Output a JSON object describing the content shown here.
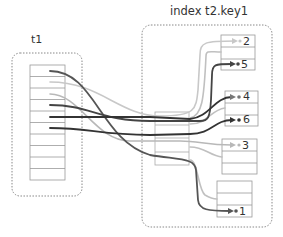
{
  "diagram": {
    "table_label": "t1",
    "index_label": "index t2.key1",
    "table_rows": 10,
    "index_pages": [
      {
        "id": "page-a",
        "entries": [
          "2",
          "",
          "5"
        ]
      },
      {
        "id": "page-b",
        "entries": [
          "4",
          "",
          "6"
        ]
      },
      {
        "id": "page-c",
        "entries": [
          "3",
          "",
          ""
        ]
      },
      {
        "id": "page-d",
        "entries": [
          "",
          "",
          "1"
        ]
      }
    ],
    "colors": {
      "dark_link": "#444444",
      "light_link": "#bbbbbb",
      "box_border": "#999999"
    }
  }
}
